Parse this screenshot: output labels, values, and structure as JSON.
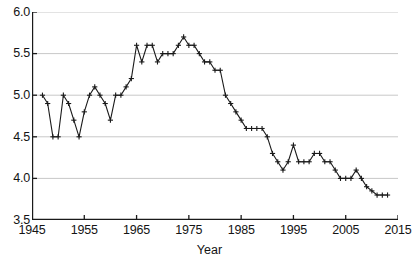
{
  "chart_data": {
    "type": "line",
    "title": "",
    "subtitle": "",
    "xlabel": "Year",
    "ylabel": "",
    "xlim": [
      1945,
      2015
    ],
    "ylim": [
      3.5,
      6.0
    ],
    "grid": "horizontal",
    "legend": "none",
    "marker": "plus",
    "line_color": "#1a1a1a",
    "grid_color": "#c8c8c8",
    "axis_color": "#1a1a1a",
    "background_color": "#ffffff",
    "xticks": [
      1945,
      1955,
      1965,
      1975,
      1985,
      1995,
      2005,
      2015
    ],
    "xticklabels": [
      "1945",
      "1955",
      "1965",
      "1975",
      "1985",
      "1995",
      "2005",
      "2015"
    ],
    "yticks": [
      3.5,
      4.0,
      4.5,
      5.0,
      5.5,
      6.0
    ],
    "yticklabels": [
      "3.5",
      "4.0",
      "4.5",
      "5.0",
      "5.5",
      "6.0"
    ],
    "series": [
      {
        "name": "value",
        "x": [
          1947,
          1948,
          1949,
          1950,
          1951,
          1952,
          1953,
          1954,
          1955,
          1956,
          1957,
          1958,
          1959,
          1960,
          1961,
          1962,
          1963,
          1964,
          1965,
          1966,
          1967,
          1968,
          1969,
          1970,
          1971,
          1972,
          1973,
          1974,
          1975,
          1976,
          1977,
          1978,
          1979,
          1980,
          1981,
          1982,
          1983,
          1984,
          1985,
          1986,
          1987,
          1988,
          1989,
          1990,
          1991,
          1992,
          1993,
          1994,
          1995,
          1996,
          1997,
          1998,
          1999,
          2000,
          2001,
          2002,
          2003,
          2004,
          2005,
          2006,
          2007,
          2008,
          2009,
          2010,
          2011,
          2012,
          2013
        ],
        "y": [
          5.0,
          4.9,
          4.5,
          4.5,
          5.0,
          4.9,
          4.7,
          4.5,
          4.8,
          5.0,
          5.1,
          5.0,
          4.9,
          4.7,
          5.0,
          5.0,
          5.1,
          5.2,
          5.6,
          5.4,
          5.6,
          5.6,
          5.4,
          5.5,
          5.5,
          5.5,
          5.6,
          5.7,
          5.6,
          5.6,
          5.5,
          5.4,
          5.4,
          5.3,
          5.3,
          5.0,
          4.9,
          4.8,
          4.7,
          4.6,
          4.6,
          4.6,
          4.6,
          4.5,
          4.3,
          4.2,
          4.1,
          4.2,
          4.4,
          4.2,
          4.2,
          4.2,
          4.3,
          4.3,
          4.2,
          4.2,
          4.1,
          4.0,
          4.0,
          4.0,
          4.1,
          4.0,
          3.9,
          3.85,
          3.8,
          3.8,
          3.8
        ]
      }
    ]
  },
  "axis": {
    "x_title": "Year"
  },
  "caption": {
    "sliver_text": ""
  }
}
